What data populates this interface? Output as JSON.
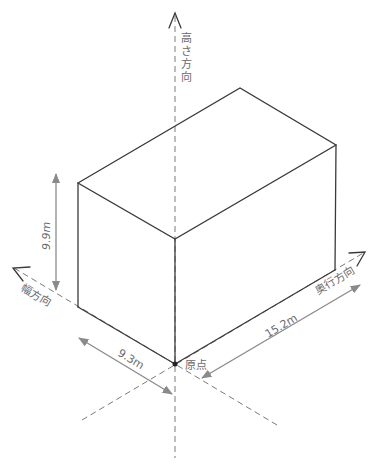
{
  "diagram": {
    "type": "isometric-box-dimensions",
    "colors": {
      "edge": "#3a3a3a",
      "axis": "#7a7a7a",
      "dimension": "#8a8a8a",
      "label": "#6a6a6a",
      "background": "#ffffff"
    },
    "axes": {
      "height": {
        "label": "高さ方向"
      },
      "width": {
        "label": "幅方向"
      },
      "depth": {
        "label": "奥行方向"
      }
    },
    "origin": {
      "label": "原点"
    },
    "dimensions": {
      "height": {
        "value": "9.9m"
      },
      "width": {
        "value": "9.3m"
      },
      "depth": {
        "value": "15.2m"
      }
    }
  }
}
